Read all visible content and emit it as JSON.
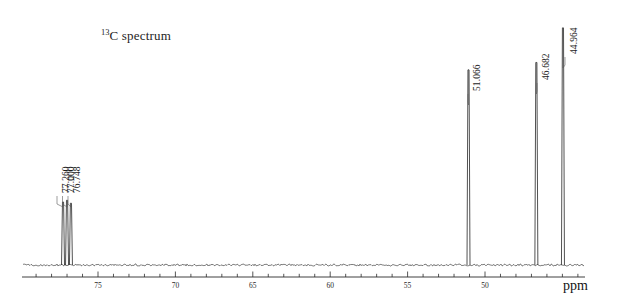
{
  "title": {
    "superscript": "13",
    "text": "C spectrum"
  },
  "axis": {
    "unit_label": "ppm",
    "tick_labels": [
      "75",
      "70",
      "65",
      "60",
      "55",
      "50"
    ],
    "tick_values": [
      75,
      70,
      65,
      60,
      55,
      50
    ]
  },
  "peak_labels": [
    {
      "text": "77.260"
    },
    {
      "text": "77.000"
    },
    {
      "text": "76.748"
    },
    {
      "text": "51.066"
    },
    {
      "text": "46.682"
    },
    {
      "text": "44.964"
    }
  ],
  "chart_data": {
    "type": "line",
    "title": "13C spectrum",
    "xlabel": "ppm",
    "ylabel": "",
    "xlim": [
      79.2,
      43.2
    ],
    "ylim": [
      0,
      1.0
    ],
    "x_axis_reversed": true,
    "grid": false,
    "legend": false,
    "major_ticks": [
      75,
      70,
      65,
      60,
      55,
      50
    ],
    "minor_tick_spacing": 1,
    "peaks": [
      {
        "shift_ppm": 77.26,
        "label": "77.260",
        "rel_height": 0.255,
        "assignment": "CDCl3"
      },
      {
        "shift_ppm": 77.0,
        "label": "77.000",
        "rel_height": 0.262,
        "assignment": "CDCl3"
      },
      {
        "shift_ppm": 76.748,
        "label": "76.748",
        "rel_height": 0.25,
        "assignment": "CDCl3"
      },
      {
        "shift_ppm": 51.066,
        "label": "51.066",
        "rel_height": 0.79,
        "assignment": ""
      },
      {
        "shift_ppm": 46.682,
        "label": "46.682",
        "rel_height": 0.82,
        "assignment": ""
      },
      {
        "shift_ppm": 44.964,
        "label": "44.964",
        "rel_height": 0.96,
        "assignment": ""
      }
    ]
  }
}
